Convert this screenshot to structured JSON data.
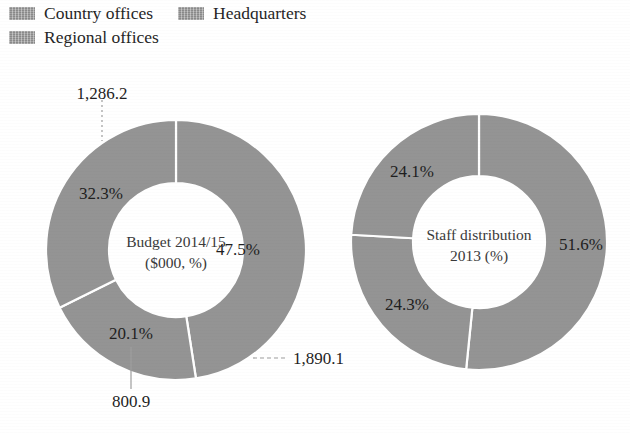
{
  "legend": {
    "items": [
      {
        "label": "Country offices",
        "swatch_color": "#9a9a9a"
      },
      {
        "label": "Headquarters",
        "swatch_color": "#9a9a9a"
      },
      {
        "label": "Regional offices",
        "swatch_color": "#9a9a9a"
      }
    ]
  },
  "chart_data": [
    {
      "type": "pie",
      "variant": "donut",
      "title": "Budget 2014/15",
      "subtitle": "($000, %)",
      "center_label_line1": "Budget 2014/15",
      "center_label_line2": "($000, %)",
      "categories": [
        "Country offices",
        "Headquarters",
        "Regional offices"
      ],
      "values": [
        1890.1,
        800.9,
        1286.2
      ],
      "percentages": [
        47.5,
        20.1,
        32.3
      ],
      "value_labels": [
        "1,890.1",
        "800.9",
        "1,286.2"
      ],
      "percent_labels": [
        "47.5%",
        "20.1%",
        "32.3%"
      ],
      "units": "$000",
      "legend_position": "top",
      "grid": false,
      "slice_color": "#949494",
      "separator_color": "#ffffff"
    },
    {
      "type": "pie",
      "variant": "donut",
      "title": "Staff distribution",
      "subtitle": "2013 (%)",
      "center_label_line1": "Staff distribution",
      "center_label_line2": "2013 (%)",
      "categories": [
        "Country offices",
        "Headquarters",
        "Regional offices"
      ],
      "values": [
        51.6,
        24.3,
        24.1
      ],
      "percentages": [
        51.6,
        24.3,
        24.1
      ],
      "value_labels": [
        "51.6%",
        "24.3%",
        "24.1%"
      ],
      "percent_labels": [
        "51.6%",
        "24.3%",
        "24.1%"
      ],
      "units": "%",
      "legend_position": "top",
      "grid": false,
      "slice_color": "#949494",
      "separator_color": "#ffffff"
    }
  ],
  "labels": {
    "donut1": {
      "pct_country": "47.5%",
      "pct_headquarters": "20.1%",
      "pct_regional": "32.3%",
      "val_country": "1,890.1",
      "val_headquarters": "800.9",
      "val_regional": "1,286.2",
      "center_line1": "Budget 2014/15",
      "center_line2": "($000, %)"
    },
    "donut2": {
      "pct_country": "51.6%",
      "pct_headquarters": "24.3%",
      "pct_regional": "24.1%",
      "center_line1": "Staff distribution",
      "center_line2": "2013 (%)"
    }
  }
}
